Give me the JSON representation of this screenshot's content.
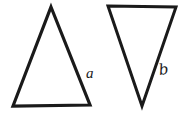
{
  "figure": {
    "background_color": "#ffffff",
    "stroke_color": "#1a1a1a",
    "canvas": {
      "width": 192,
      "height": 118
    },
    "style": "hand-drawn ink outline, unfilled"
  },
  "shapes": [
    {
      "id": "triangle-up",
      "name": "upward-pointing triangle",
      "orientation": "apex-up",
      "fill": "none",
      "stroke": "#1a1a1a",
      "stroke_width": 3.2,
      "points": "51,7 90,105 13,106",
      "label": "a"
    },
    {
      "id": "triangle-down",
      "name": "downward-pointing triangle",
      "orientation": "apex-down",
      "fill": "none",
      "stroke": "#1a1a1a",
      "stroke_width": 3.0,
      "points": "108,6 176,7 142,106",
      "label": "b"
    }
  ],
  "labels": {
    "a": "a",
    "b": "b"
  }
}
